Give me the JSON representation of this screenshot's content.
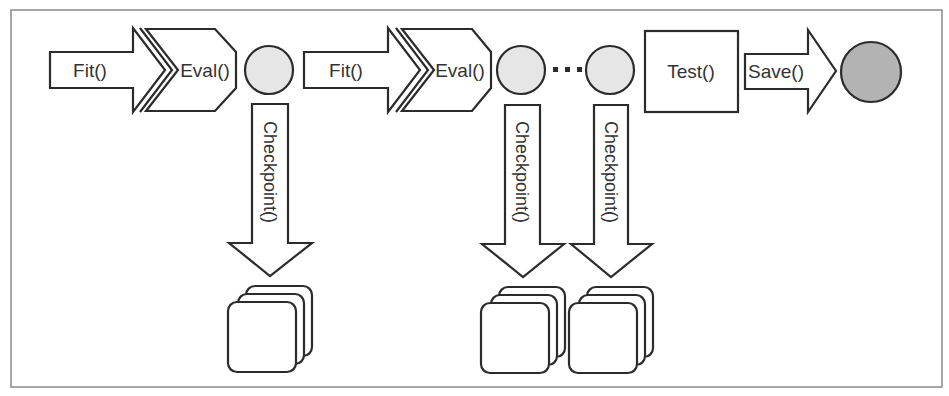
{
  "diagram": {
    "colors": {
      "stroke": "#2b2b2b",
      "frame": "#8a8a8a",
      "checkpoint_circle_fill": "#e6e6e6",
      "saved_model_fill": "#b3b3b3",
      "text": "#333333"
    },
    "pipeline": [
      {
        "type": "arrow",
        "label": "Fit()"
      },
      {
        "type": "chevron",
        "label": "Eval()"
      },
      {
        "type": "circle",
        "role": "checkpoint-state"
      },
      {
        "type": "arrow",
        "label": "Fit()"
      },
      {
        "type": "chevron",
        "label": "Eval()"
      },
      {
        "type": "circle",
        "role": "checkpoint-state"
      },
      {
        "type": "ellipsis",
        "label": "..."
      },
      {
        "type": "circle",
        "role": "checkpoint-state"
      },
      {
        "type": "box",
        "label": "Test()"
      },
      {
        "type": "arrow",
        "label": "Save()"
      },
      {
        "type": "circle",
        "role": "saved-model"
      }
    ],
    "labels": {
      "fit_1": "Fit()",
      "eval_1": "Eval()",
      "fit_2": "Fit()",
      "eval_2": "Eval()",
      "test": "Test()",
      "save": "Save()",
      "checkpoint_1": "Checkpoint()",
      "checkpoint_2": "Checkpoint()",
      "checkpoint_3": "Checkpoint()"
    },
    "checkpoint_stacks": [
      {
        "under": "circle_1",
        "cards": 3
      },
      {
        "under": "circle_2",
        "cards": 3
      },
      {
        "under": "circle_3",
        "cards": 3
      }
    ]
  }
}
